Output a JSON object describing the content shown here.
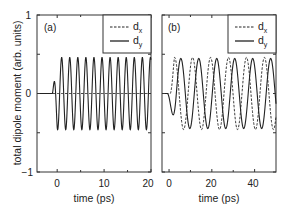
{
  "figure": {
    "y_axis_label": "total dipole moment (arb. units)",
    "x_axis_label": "time (ps)"
  },
  "chart_data": [
    {
      "type": "line",
      "panel_label": "(a)",
      "title": "",
      "xlabel": "time (ps)",
      "ylabel": "total dipole moment (arb. units)",
      "xlim": [
        -4.3,
        20
      ],
      "ylim": [
        -1,
        1
      ],
      "xticks": [
        0,
        10,
        20
      ],
      "xtick_labels": [
        "0",
        "10",
        "20"
      ],
      "yticks": [
        -1,
        0,
        1
      ],
      "ytick_labels": [
        "−1",
        "0",
        "1"
      ],
      "minor_yticks": [
        -0.5,
        0.5
      ],
      "minor_xticks": [
        5,
        15
      ],
      "grid": false,
      "legend": {
        "position": "upper right",
        "entries": [
          {
            "label": "d",
            "sub": "x",
            "style": "dashed"
          },
          {
            "label": "d",
            "sub": "y",
            "style": "solid"
          }
        ]
      },
      "series": [
        {
          "name": "dx",
          "style": "dashed",
          "description": "stays at 0 for all t",
          "model": {
            "kind": "constant",
            "value": 0
          }
        },
        {
          "name": "dy",
          "style": "solid",
          "description": "0 for t<-1, dips to about -0.45 near t=0, then oscillates with amplitude ~0.46, period ~1.7 ps (12 peaks between t=1.3 and t=20)",
          "model": {
            "kind": "damped_start_sine",
            "t_start": -1.0,
            "amplitude": 0.46,
            "period": 1.72,
            "phase_first_trough": 0.1,
            "offset": 0
          },
          "peaks_t": [
            1.3,
            3.0,
            4.7,
            6.4,
            8.2,
            9.9,
            11.6,
            13.3,
            15.0,
            16.8,
            18.5,
            20.0
          ],
          "peak_value": 0.47,
          "trough_value": -0.45
        }
      ]
    },
    {
      "type": "line",
      "panel_label": "(b)",
      "title": "",
      "xlabel": "time (ps)",
      "ylabel": "",
      "xlim": [
        -3.3,
        50
      ],
      "ylim": [
        -1,
        1
      ],
      "xticks": [
        0,
        20,
        40
      ],
      "xtick_labels": [
        "0",
        "20",
        "40"
      ],
      "minor_xticks": [
        10,
        30
      ],
      "minor_yticks": [
        -0.5,
        0.5
      ],
      "grid": false,
      "legend": {
        "position": "upper right",
        "entries": [
          {
            "label": "d",
            "sub": "x",
            "style": "dashed"
          },
          {
            "label": "d",
            "sub": "y",
            "style": "solid"
          }
        ]
      },
      "series": [
        {
          "name": "dx",
          "style": "dashed",
          "description": "starts at 0, oscillates with amplitude ~0.46, period ~8.3 ps, leading dy by ~1.5 ps",
          "model": {
            "kind": "sine",
            "t_start": 0.5,
            "amplitude": 0.46,
            "period": 8.4,
            "lead": 1.6
          },
          "troughs_t": [
            9.9,
            18.4,
            26.5,
            35.0,
            43.3
          ]
        },
        {
          "name": "dy",
          "style": "solid",
          "description": "0 before t~-1, small dip (~-0.05) near t=0, first deep trough ~-0.42 at t~3.3, then oscillates amplitude ~0.46, period ~8.3 ps",
          "model": {
            "kind": "sine",
            "t_start": -0.8,
            "amplitude": 0.46,
            "period": 8.4
          },
          "troughs_t": [
            3.3,
            11.6,
            20.3,
            27.9,
            37.0,
            45.6
          ],
          "peak_value": 0.46,
          "trough_value": -0.44
        }
      ]
    }
  ]
}
